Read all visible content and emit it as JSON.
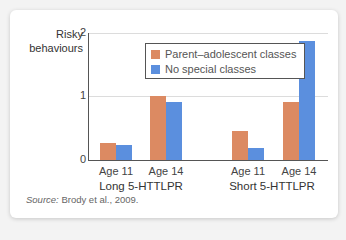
{
  "colors": {
    "parent_adolescent": "#dc8a62",
    "no_special": "#5b8fde",
    "background": "#f3f3f3",
    "card": "#ffffff"
  },
  "chart_data": {
    "type": "bar",
    "title": "",
    "ylabel": "Risky behaviours",
    "xlabel": "",
    "ylim": [
      0,
      2
    ],
    "yticks": [
      "0",
      "1",
      "2"
    ],
    "grid": true,
    "legend_position": "upper center",
    "groups": [
      "Long 5-HTTLPR",
      "Short 5-HTTLPR"
    ],
    "categories": [
      "Age 11",
      "Age 14",
      "Age 11",
      "Age 14"
    ],
    "series": [
      {
        "name": "Parent–adolescent classes",
        "values": [
          0.27,
          1.0,
          0.45,
          0.91
        ]
      },
      {
        "name": "No special classes",
        "values": [
          0.24,
          0.91,
          0.19,
          1.87
        ]
      }
    ],
    "source": "Brody et al., 2009."
  },
  "labels": {
    "ylabel_line1": "Risky",
    "ylabel_line2": "behaviours",
    "ytick_0": "0",
    "ytick_1": "1",
    "ytick_2": "2",
    "legend_0": "Parent–adolescent classes",
    "legend_1": "No special classes",
    "xtick_0": "Age 11",
    "xtick_1": "Age 14",
    "xtick_2": "Age 11",
    "xtick_3": "Age 14",
    "group_0": "Long 5-HTTLPR",
    "group_1": "Short 5-HTTLPR",
    "source_prefix": "Source:",
    "source_text": " Brody et al., 2009."
  }
}
